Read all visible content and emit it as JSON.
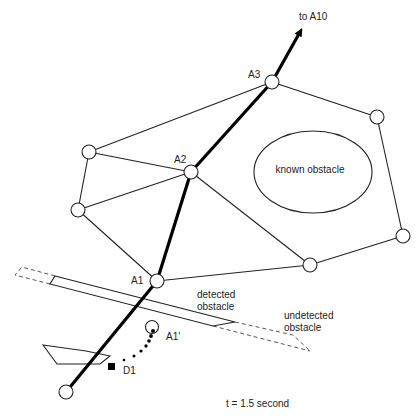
{
  "diagram": {
    "labels": {
      "to_a10": "to A10",
      "a1": "A1",
      "a2": "A2",
      "a3": "A3",
      "a1_prime": "A1'",
      "d1": "D1",
      "known_obstacle": "known obstacle",
      "detected_obstacle_line1": "detected",
      "detected_obstacle_line2": "obstacle",
      "undetected_obstacle_line1": "undetected",
      "undetected_obstacle_line2": "obstacle",
      "time": "t = 1.5 second"
    },
    "nodes": [
      {
        "id": "start",
        "x": 66,
        "y": 392
      },
      {
        "id": "A1",
        "x": 157,
        "y": 281
      },
      {
        "id": "A2",
        "x": 191,
        "y": 172
      },
      {
        "id": "A3",
        "x": 272,
        "y": 82
      },
      {
        "id": "left-upper",
        "x": 89,
        "y": 152
      },
      {
        "id": "left-lower",
        "x": 78,
        "y": 210
      },
      {
        "id": "top-right",
        "x": 377,
        "y": 117
      },
      {
        "id": "right",
        "x": 403,
        "y": 236
      },
      {
        "id": "bottom-right",
        "x": 310,
        "y": 265
      }
    ],
    "colors": {
      "line": "#222222",
      "path": "#000000",
      "background": "#ffffff"
    }
  }
}
